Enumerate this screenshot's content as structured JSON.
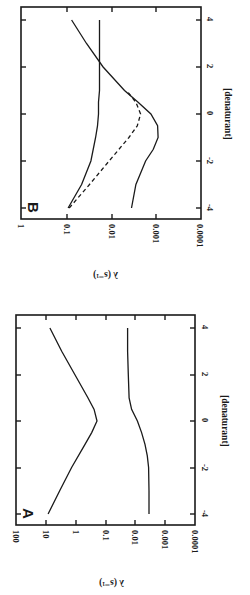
{
  "chart_data": [
    {
      "panel": "B",
      "type": "line",
      "orientation": "figure rotated 90° clockwise",
      "xlabel": "[denaturant]",
      "ylabel": "λ (s⁻¹)",
      "yscale": "log",
      "xlim": [
        -4,
        4
      ],
      "ylim": [
        0.0001,
        1
      ],
      "xticks": [
        "-4",
        "-2",
        "0",
        "2",
        "4"
      ],
      "yticks": [
        "1",
        "0.1",
        "0.01",
        "0.001",
        "0.0001"
      ],
      "grid": false,
      "series": [
        {
          "name": "fast rate (solid, rising)",
          "style": "solid",
          "x": [
            -4,
            -3,
            -2,
            -1,
            -0.5,
            0,
            0.5,
            1,
            2,
            3,
            4
          ],
          "y": [
            0.09,
            0.045,
            0.028,
            0.022,
            0.02,
            0.019,
            0.019,
            0.018,
            0.018,
            0.018,
            0.018
          ]
        },
        {
          "name": "slow rate (solid, dip)",
          "style": "solid",
          "x": [
            -4,
            -3,
            -2,
            -1.5,
            -1,
            -0.5,
            0,
            0.5,
            1,
            2,
            3,
            4
          ],
          "y": [
            0.0035,
            0.0028,
            0.0017,
            0.00115,
            0.0009,
            0.00092,
            0.0013,
            0.0025,
            0.005,
            0.015,
            0.035,
            0.075
          ]
        },
        {
          "name": "dashed",
          "style": "dashed",
          "x": [
            -4,
            -3,
            -2,
            -1,
            -0.5,
            0,
            0.5,
            1
          ],
          "y": [
            0.085,
            0.03,
            0.011,
            0.004,
            0.0026,
            0.0022,
            0.0028,
            0.0045
          ]
        },
        {
          "name": "crossing line",
          "style": "solid",
          "note": "near-vertical line in rotated view, constant ≈0.018 at high denaturant"
        }
      ]
    },
    {
      "panel": "A",
      "type": "line",
      "orientation": "figure rotated 90° clockwise",
      "xlabel": "[denaturant]",
      "ylabel": "λ (s⁻¹)",
      "yscale": "log",
      "xlim": [
        -4,
        4
      ],
      "ylim": [
        0.0001,
        100
      ],
      "xticks": [
        "-4",
        "-2",
        "0",
        "2",
        "4"
      ],
      "yticks": [
        "100",
        "10",
        "1",
        "0.1",
        "0.01",
        "0.001",
        "0.0001"
      ],
      "grid": false,
      "series": [
        {
          "name": "fast rate (chevron)",
          "style": "solid",
          "x": [
            -4,
            -3,
            -2,
            -1,
            -0.5,
            0,
            0.5,
            1,
            2,
            3,
            4
          ],
          "y": [
            8.5,
            3.5,
            1.4,
            0.5,
            0.3,
            0.2,
            0.25,
            0.4,
            1.1,
            3.0,
            7.4
          ]
        },
        {
          "name": "slow rate (sigmoid)",
          "style": "solid",
          "x": [
            -4,
            -3,
            -2,
            -1.5,
            -1,
            -0.5,
            0,
            0.5,
            1,
            2,
            3,
            4
          ],
          "y": [
            0.0037,
            0.0037,
            0.0038,
            0.0042,
            0.005,
            0.0065,
            0.009,
            0.014,
            0.017,
            0.018,
            0.019,
            0.019
          ]
        }
      ]
    }
  ],
  "panels": {
    "B": {
      "letter": "B",
      "xlabel": "[denaturant]",
      "ylabel": "λ (s⁻¹)",
      "xticks": [
        "-4",
        "-2",
        "0",
        "2",
        "4"
      ],
      "yticks": [
        "1",
        "0.1",
        "0.01",
        "0.001",
        "0.0001"
      ]
    },
    "A": {
      "letter": "A",
      "xlabel": "[denaturant]",
      "ylabel": "λ (s⁻¹)",
      "xticks": [
        "-4",
        "-2",
        "0",
        "2",
        "4"
      ],
      "yticks": [
        "100",
        "10",
        "1",
        "0.1",
        "0.01",
        "0.001",
        "0.0001"
      ]
    }
  }
}
